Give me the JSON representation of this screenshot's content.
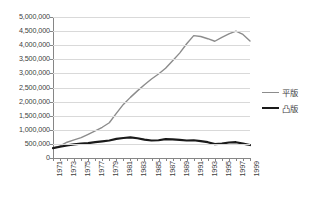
{
  "chart_data": {
    "type": "line",
    "title": "",
    "xlabel": "",
    "ylabel": "",
    "grid": true,
    "legend_position": "right",
    "ylim": [
      0,
      5000000
    ],
    "ytick_labels": [
      "5,000,000",
      "4,500,000",
      "4,000,000",
      "3,500,000",
      "3,000,000",
      "2,500,000",
      "2,000,000",
      "1,500,000",
      "1,000,000",
      "500,000",
      "0"
    ],
    "ytick_values": [
      5000000,
      4500000,
      4000000,
      3500000,
      3000000,
      2500000,
      2000000,
      1500000,
      1000000,
      500000,
      0
    ],
    "x": [
      1971,
      1972,
      1973,
      1974,
      1975,
      1976,
      1977,
      1978,
      1979,
      1980,
      1981,
      1982,
      1983,
      1984,
      1985,
      1986,
      1987,
      1988,
      1989,
      1990,
      1991,
      1992,
      1993,
      1994,
      1995,
      1996,
      1997,
      1998,
      1999
    ],
    "xtick_labels": [
      "1971",
      "1973",
      "1975",
      "1977",
      "1979",
      "1981",
      "1983",
      "1985",
      "1987",
      "1989",
      "1991",
      "1993",
      "1995",
      "1997",
      "1999"
    ],
    "xtick_values": [
      1971,
      1973,
      1975,
      1977,
      1979,
      1981,
      1983,
      1985,
      1987,
      1989,
      1991,
      1993,
      1995,
      1997,
      1999
    ],
    "series": [
      {
        "name": "平版",
        "color": "#8c8c8c",
        "width": 1.4,
        "values": [
          350000,
          430000,
          560000,
          640000,
          720000,
          840000,
          960000,
          1090000,
          1250000,
          1580000,
          1900000,
          2150000,
          2380000,
          2600000,
          2800000,
          2980000,
          3180000,
          3450000,
          3720000,
          4050000,
          4340000,
          4310000,
          4230000,
          4140000,
          4280000,
          4400000,
          4500000,
          4380000,
          4150000
        ]
      },
      {
        "name": "凸版",
        "color": "#1a1a1a",
        "width": 2.2,
        "values": [
          350000,
          400000,
          450000,
          480000,
          510000,
          530000,
          560000,
          590000,
          620000,
          680000,
          710000,
          730000,
          700000,
          650000,
          620000,
          630000,
          670000,
          660000,
          640000,
          620000,
          630000,
          600000,
          560000,
          490000,
          510000,
          550000,
          560000,
          510000,
          460000
        ]
      }
    ]
  },
  "legend": {
    "entries": [
      {
        "label": "平版"
      },
      {
        "label": "凸版"
      }
    ]
  }
}
